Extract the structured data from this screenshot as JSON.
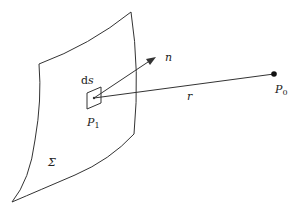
{
  "figure": {
    "labels": {
      "ds_prefix": "d",
      "ds_var": "s",
      "normal": "n",
      "distance": "r",
      "point_source": "P",
      "point_source_sub": "1",
      "point_obs": "P",
      "point_obs_sub": "0",
      "surface": "Σ"
    },
    "colors": {
      "stroke": "#333333",
      "background": "#ffffff"
    }
  }
}
